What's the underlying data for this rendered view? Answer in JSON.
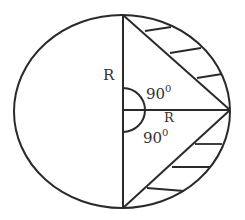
{
  "diagram": {
    "type": "geometry",
    "shape": "circle with two inscribed right triangles sharing a radius",
    "labels": {
      "radius_vertical": "R",
      "radius_horizontal": "R",
      "angle_upper": "90",
      "angle_upper_sup": "0",
      "angle_lower": "90",
      "angle_lower_sup": "0"
    },
    "colors": {
      "stroke": "#2a2a2a",
      "background": "#ffffff"
    },
    "shaded_regions": [
      "upper-right segment",
      "lower-right segment"
    ]
  }
}
